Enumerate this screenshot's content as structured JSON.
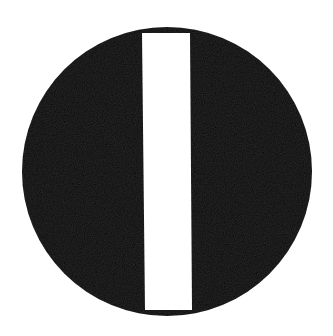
{
  "symbol": {
    "name": "circle with vertical white bar",
    "colors": {
      "background": "#ffffff",
      "disc": "#050505",
      "bar": "#ffffff"
    },
    "disc": {
      "cx": 167,
      "cy": 171.5,
      "rx": 145,
      "ry": 144.5
    },
    "bar": {
      "top_left": [
        142,
        33
      ],
      "top_right": [
        190,
        33
      ],
      "bottom_right": [
        192,
        310
      ],
      "bottom_left": [
        145,
        310
      ]
    }
  }
}
